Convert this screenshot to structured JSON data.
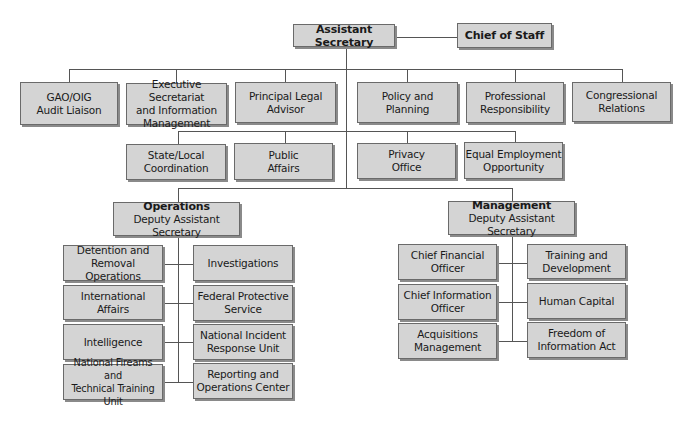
{
  "top": {
    "assistant_secretary": "Assistant Secretary",
    "chief_of_staff": "Chief of Staff"
  },
  "tier1": [
    "GAO/OIG\nAudit Liaison",
    "Executive Secretariat\nand  Information\nManagement",
    "Principal Legal\nAdvisor",
    "Policy and\nPlanning",
    "Professional\nResponsibility",
    "Congressional\nRelations"
  ],
  "tier2": [
    "State/Local\nCoordination",
    "Public\nAffairs",
    "Privacy\nOffice",
    "Equal Employment\nOpportunity"
  ],
  "operations": {
    "title": "Operations",
    "subtitle": "Deputy Assistant Secretary",
    "left": [
      "Detention and\nRemoval Operations",
      "International Affairs",
      "Intelligence",
      "National Fireams and\nTechnical Training Unit"
    ],
    "right": [
      "Investigations",
      "Federal Protective\nService",
      "National Incident\nResponse Unit",
      "Reporting and\nOperations Center"
    ]
  },
  "management": {
    "title": "Management",
    "subtitle": "Deputy Assistant Secretary",
    "left": [
      "Chief Financial\nOfficer",
      "Chief Information\nOfficer",
      "Acquisitions\nManagement"
    ],
    "right": [
      "Training and\nDevelopment",
      "Human Capital",
      "Freedom of\nInformation Act"
    ]
  },
  "colors": {
    "box_fill": "#d4d4d4",
    "box_border": "#6a6a6a",
    "line": "#555555"
  }
}
